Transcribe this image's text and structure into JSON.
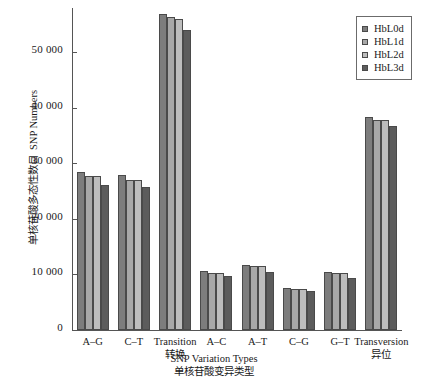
{
  "chart_data": {
    "type": "bar",
    "title": "",
    "xlabel": "SNP Variation Types",
    "xlabel_cn": "单核苷酸变异类型",
    "ylabel": "SNP Numbers",
    "ylabel_cn": "单核苷酸多态性数目",
    "ylim": [
      0,
      58000
    ],
    "yticks": [
      0,
      10000,
      20000,
      30000,
      40000,
      50000
    ],
    "ytick_labels": [
      "0",
      "10 000",
      "20 000",
      "30 000",
      "40 000",
      "50 000"
    ],
    "grid": false,
    "legend_position": "top-right",
    "categories": [
      "A–G",
      "C–T",
      "Transition",
      "A–C",
      "A–T",
      "C–G",
      "G–T",
      "Transversion"
    ],
    "category_sublabels": [
      "",
      "",
      "转换",
      "",
      "",
      "",
      "",
      "异位"
    ],
    "series": [
      {
        "name": "HbL0d",
        "color": "#7d7d7d",
        "values": [
          28500,
          28000,
          57000,
          10600,
          11700,
          7600,
          10500,
          38300
        ]
      },
      {
        "name": "HbL1d",
        "color": "#a8a8a8",
        "values": [
          27800,
          27100,
          56300,
          10300,
          11500,
          7400,
          10300,
          37900
        ]
      },
      {
        "name": "HbL2d",
        "color": "#bdbdbd",
        "values": [
          27800,
          27100,
          56100,
          10300,
          11500,
          7400,
          10300,
          37900
        ]
      },
      {
        "name": "HbL3d",
        "color": "#5c5c5c",
        "values": [
          26200,
          25700,
          54000,
          9700,
          10500,
          7000,
          9400,
          36700
        ]
      }
    ]
  },
  "legend": {
    "items": [
      {
        "label": "HbL0d",
        "color": "#7d7d7d"
      },
      {
        "label": "HbL1d",
        "color": "#a8a8a8"
      },
      {
        "label": "HbL2d",
        "color": "#bdbdbd"
      },
      {
        "label": "HbL3d",
        "color": "#5c5c5c"
      }
    ]
  },
  "axes": {
    "y_title_en": "SNP Numbers",
    "y_title_cn": "单核苷酸多态性数目",
    "x_title_en": "SNP Variation Types",
    "x_title_cn": "单核苷酸变异类型"
  }
}
